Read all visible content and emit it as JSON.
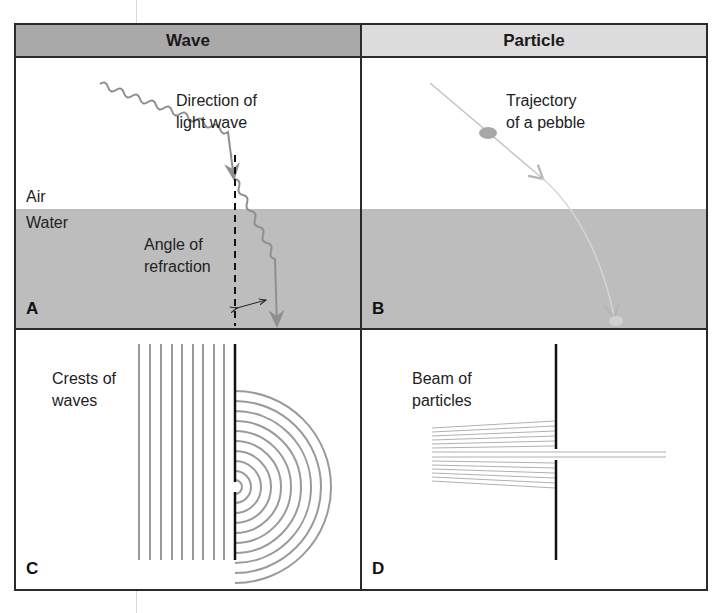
{
  "headers": {
    "wave": "Wave",
    "particle": "Particle"
  },
  "colors": {
    "header_wave": "#a9a9a9",
    "header_particle": "#dcdcdc",
    "water": "#bdbdbd",
    "border": "#2a2a2a",
    "line_gray": "#8f8f8f"
  },
  "panels": {
    "A": {
      "letter": "A",
      "label_direction_line1": "Direction of",
      "label_direction_line2": "light wave",
      "label_air": "Air",
      "label_water": "Water",
      "label_angle_line1": "Angle of",
      "label_angle_line2": "refraction"
    },
    "B": {
      "letter": "B",
      "label_line1": "Trajectory",
      "label_line2": "of a pebble"
    },
    "C": {
      "letter": "C",
      "label_line1": "Crests of",
      "label_line2": "waves"
    },
    "D": {
      "letter": "D",
      "label_line1": "Beam of",
      "label_line2": "particles"
    }
  }
}
